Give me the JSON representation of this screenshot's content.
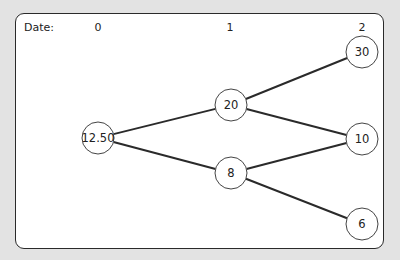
{
  "diagram": {
    "type": "binomial-tree",
    "date_label": "Date:",
    "periods": [
      "0",
      "1",
      "2"
    ],
    "nodes": [
      {
        "id": "n0",
        "value": "12.50",
        "period": 0,
        "cx": 98,
        "cy": 138
      },
      {
        "id": "n1u",
        "value": "20",
        "period": 1,
        "cx": 231,
        "cy": 105
      },
      {
        "id": "n1d",
        "value": "8",
        "period": 1,
        "cx": 231,
        "cy": 173
      },
      {
        "id": "n2uu",
        "value": "30",
        "period": 2,
        "cx": 362,
        "cy": 52
      },
      {
        "id": "n2ud",
        "value": "10",
        "period": 2,
        "cx": 362,
        "cy": 139
      },
      {
        "id": "n2dd",
        "value": "6",
        "period": 2,
        "cx": 362,
        "cy": 224
      }
    ],
    "edges": [
      [
        "n0",
        "n1u"
      ],
      [
        "n0",
        "n1d"
      ],
      [
        "n1u",
        "n2uu"
      ],
      [
        "n1u",
        "n2ud"
      ],
      [
        "n1d",
        "n2ud"
      ],
      [
        "n1d",
        "n2dd"
      ]
    ],
    "colors": {
      "background": "#e3e3e3",
      "panel": "#ffffff",
      "stroke": "#2a2a2a"
    }
  }
}
